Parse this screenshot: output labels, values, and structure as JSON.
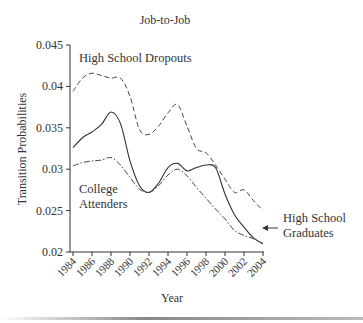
{
  "chart_data": {
    "type": "line",
    "title": "Job-to-Job",
    "xlabel": "Year",
    "ylabel": "Transition Probabilities",
    "ylim": [
      0.02,
      0.045
    ],
    "xlim": [
      1984,
      2004
    ],
    "grid": false,
    "legend": "inline annotations",
    "y_ticks": [
      "0.02",
      "0.025",
      "0.03",
      "0.035",
      "0.04",
      "0.045"
    ],
    "x_ticks": [
      "1984",
      "1986",
      "1988",
      "1990",
      "1992",
      "1994",
      "1996",
      "1998",
      "2000",
      "2002",
      "2004"
    ],
    "x": [
      1984,
      1985,
      1986,
      1987,
      1988,
      1989,
      1990,
      1991,
      1992,
      1993,
      1994,
      1995,
      1996,
      1997,
      1998,
      1999,
      2000,
      2001,
      2002,
      2003,
      2004
    ],
    "series": [
      {
        "name": "High School Dropouts",
        "style": "dashed",
        "values": [
          0.0394,
          0.041,
          0.0416,
          0.0413,
          0.041,
          0.041,
          0.0388,
          0.0348,
          0.0342,
          0.0352,
          0.0368,
          0.0378,
          0.0352,
          0.0325,
          0.032,
          0.0305,
          0.0288,
          0.0272,
          0.0275,
          0.0262,
          0.025
        ]
      },
      {
        "name": "High School Graduates",
        "style": "solid",
        "values": [
          0.0326,
          0.0338,
          0.0345,
          0.0354,
          0.0369,
          0.0355,
          0.031,
          0.028,
          0.0272,
          0.0283,
          0.0302,
          0.0307,
          0.0298,
          0.0302,
          0.0305,
          0.0302,
          0.027,
          0.0245,
          0.023,
          0.0217,
          0.021
        ]
      },
      {
        "name": "College Attenders",
        "style": "dash-dot",
        "values": [
          0.0304,
          0.0308,
          0.031,
          0.0311,
          0.0314,
          0.0305,
          0.029,
          0.0276,
          0.0272,
          0.028,
          0.0293,
          0.03,
          0.0292,
          0.0278,
          0.0265,
          0.0252,
          0.024,
          0.0226,
          0.022,
          0.0216,
          0.021
        ]
      }
    ],
    "annotations": [
      {
        "text": "High School Dropouts"
      },
      {
        "text": "College"
      },
      {
        "text": "Attenders"
      },
      {
        "text": "High School"
      },
      {
        "text": "Graduates"
      }
    ]
  },
  "labels": {
    "title": "Job-to-Job",
    "xlabel": "Year",
    "ylabel": "Transition Probabilities",
    "dropouts": "High School Dropouts",
    "college_1": "College",
    "college_2": "Attenders",
    "grads_1": "High School",
    "grads_2": "Graduates"
  },
  "colors": {
    "line": "#333333",
    "dashed": "#444444",
    "text": "#333333"
  }
}
